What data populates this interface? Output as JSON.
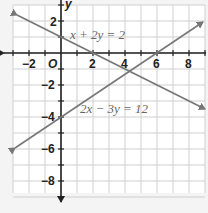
{
  "chart_data": {
    "type": "line",
    "title": "",
    "xlabel": "x",
    "ylabel": "y",
    "xlim": [
      -3,
      9
    ],
    "ylim": [
      -9,
      3
    ],
    "grid": true,
    "x_tick_labels": [
      "-2",
      "2",
      "4",
      "6",
      "8"
    ],
    "y_tick_labels": [
      "2",
      "-2",
      "-4",
      "-6",
      "-8"
    ],
    "origin_label": "O",
    "series": [
      {
        "name": "x + 2y = 2",
        "equation": "x + 2y = 2",
        "x": [
          -3,
          9
        ],
        "y": [
          2.5,
          -3.5
        ],
        "color": "#777777"
      },
      {
        "name": "2x − 3y = 12",
        "equation": "2x − 3y = 12",
        "x": [
          -3,
          9
        ],
        "y": [
          -6,
          2
        ],
        "color": "#777777"
      }
    ],
    "annotations": [
      {
        "text": "x + 2y = 2",
        "at": [
          0.8,
          1.5
        ]
      },
      {
        "text": "2x − 3y = 12",
        "at": [
          1.5,
          -3.5
        ]
      }
    ]
  },
  "labels": {
    "eq1": "x + 2y = 2",
    "eq2": "2x − 3y = 12",
    "y_axis": "y",
    "origin": "O",
    "xt_m2": "−2",
    "xt_2": "2",
    "xt_4": "4",
    "xt_6": "6",
    "xt_8": "8",
    "yt_2": "2",
    "yt_m2": "−2",
    "yt_m4": "−4",
    "yt_m6": "−6",
    "yt_m8": "−8"
  }
}
